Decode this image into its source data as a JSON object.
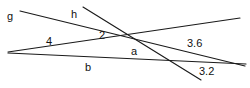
{
  "figure": {
    "kind": "geometry-line-diagram",
    "width": 250,
    "height": 88,
    "background_color": "#ffffff",
    "stroke_color": "#1a1a1a",
    "text_color": "#111111",
    "labels": {
      "g": "g",
      "h": "h",
      "two": "2",
      "four": "4",
      "a": "a",
      "b": "b",
      "three_six": "3.6",
      "three_two": "3.2"
    },
    "lines": [
      {
        "name": "line-g",
        "label": "g",
        "x1": 20,
        "y1": 11,
        "x2": 245,
        "y2": 66
      },
      {
        "name": "line-h",
        "label": "h",
        "x1": 83,
        "y1": 7,
        "x2": 201,
        "y2": 80
      },
      {
        "name": "line-upper",
        "label": "4",
        "x1": 8,
        "y1": 52,
        "x2": 240,
        "y2": 18
      },
      {
        "name": "line-lower",
        "label": "b",
        "x1": 8,
        "y1": 53,
        "x2": 246,
        "y2": 64
      }
    ]
  }
}
